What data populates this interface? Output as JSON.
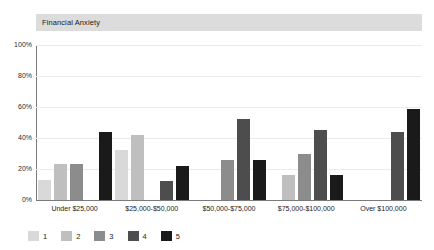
{
  "chart_data": {
    "type": "bar",
    "title": "Financial Anxiety",
    "xlabel": "",
    "ylabel": "",
    "ylim": [
      0,
      100
    ],
    "yticks": [
      "0%",
      "20%",
      "40%",
      "60%",
      "80%",
      "100%"
    ],
    "ytick_values": [
      0,
      20,
      40,
      60,
      80,
      100
    ],
    "grid": true,
    "legend_position": "bottom-left",
    "categories": [
      "Under $25,000",
      "$25,000-$50,000",
      "$50,000-$75,000",
      "$75,000-$100,000",
      "Over $100,000"
    ],
    "series": [
      {
        "name": "1",
        "color": "#d9d9d9",
        "values": [
          13,
          32,
          null,
          null,
          null
        ]
      },
      {
        "name": "2",
        "color": "#bfbfbf",
        "values": [
          23,
          42,
          null,
          16,
          null
        ]
      },
      {
        "name": "3",
        "color": "#8c8c8c",
        "values": [
          23,
          null,
          26,
          30,
          null
        ]
      },
      {
        "name": "4",
        "color": "#4d4d4d",
        "values": [
          null,
          12,
          52,
          45,
          44
        ]
      },
      {
        "name": "5",
        "color": "#1a1a1a",
        "values": [
          44,
          22,
          26,
          16,
          59
        ]
      }
    ]
  },
  "legend": {
    "items": [
      {
        "label": "1",
        "color": "#d9d9d9"
      },
      {
        "label": "2",
        "color": "#bfbfbf"
      },
      {
        "label": "3",
        "color": "#8c8c8c"
      },
      {
        "label": "4",
        "color": "#4d4d4d"
      },
      {
        "label": "5",
        "color": "#1a1a1a"
      }
    ]
  },
  "style": {
    "title_band_bg": "#dcdcdc",
    "gridline_color": "#ebebeb",
    "axis_color": "#7a7a7a",
    "background": "#ffffff"
  }
}
